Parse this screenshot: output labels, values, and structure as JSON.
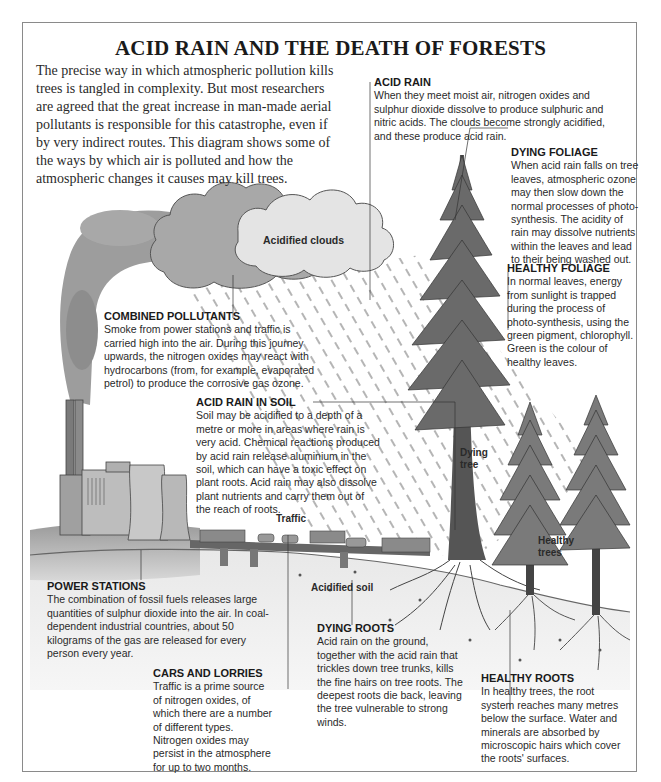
{
  "title": "ACID RAIN AND THE DEATH OF FORESTS",
  "intro": "The precise way in which atmospheric pollution kills trees is tangled in complexity. But most researchers are agreed that the great increase in man-made aerial pollutants is responsible for this catastrophe, even if by very indirect routes. This diagram shows some of the ways by which air is polluted and how the atmospheric changes it causes may kill trees.",
  "diagram_labels": {
    "acidified_clouds": "Acidified clouds",
    "traffic": "Traffic",
    "dying_tree_1": "Dying",
    "dying_tree_2": "tree",
    "healthy_trees_1": "Healthy",
    "healthy_trees_2": "trees",
    "acidified_soil": "Acidified soil"
  },
  "annotations": {
    "acid_rain": {
      "heading": "ACID RAIN",
      "body": "When they meet moist air, nitrogen oxides and sulphur dioxide dissolve to produce sulphuric and nitric acids. The clouds become strongly acidified, and these produce acid rain."
    },
    "dying_foliage": {
      "heading": "DYING FOLIAGE",
      "body": "When acid rain falls on tree leaves, atmospheric ozone may then slow down the normal processes of photo-synthesis. The acidity of rain may dissolve nutrients within the leaves and lead to their being washed out."
    },
    "healthy_foliage": {
      "heading": "HEALTHY FOLIAGE",
      "body": "In normal leaves, energy from sunlight is trapped during the process of photo-synthesis, using the green pigment, chlorophyll. Green is the colour of healthy leaves."
    },
    "combined_pollutants": {
      "heading": "COMBINED POLLUTANTS",
      "body": "Smoke from power stations and traffic is carried high into the air. During this journey upwards, the nitrogen oxides may react with hydrocarbons (from, for example, evaporated petrol) to produce the corrosive gas ozone."
    },
    "acid_rain_in_soil": {
      "heading": "ACID RAIN IN SOIL",
      "body": "Soil may be acidified to a depth of a metre or more in areas where rain is very acid. Chemical reactions produced by acid rain release aluminium in the soil, which can have a toxic effect on plant roots. Acid rain may also dissolve plant nutrients and carry them out of the reach of roots."
    },
    "power_stations": {
      "heading": "POWER STATIONS",
      "body": "The combination of fossil fuels releases large quantities of sulphur dioxide into the air. In coal-dependent industrial countries, about 50 kilograms of the gas are released for every person every year."
    },
    "cars_and_lorries": {
      "heading": "CARS AND LORRIES",
      "body": "Traffic is a prime source of nitrogen oxides, of which there are a number of different types. Nitrogen oxides may persist in the atmosphere for up to two months."
    },
    "dying_roots": {
      "heading": "DYING ROOTS",
      "body": "Acid rain on the ground, together with the acid rain that trickles down tree trunks, kills the fine hairs on tree roots. The deepest roots die back, leaving the tree vulnerable to strong winds."
    },
    "healthy_roots": {
      "heading": "HEALTHY ROOTS",
      "body": "In healthy trees, the root system reaches many metres below the surface. Water and minerals are absorbed by microscopic hairs which cover the roots' surfaces."
    }
  }
}
